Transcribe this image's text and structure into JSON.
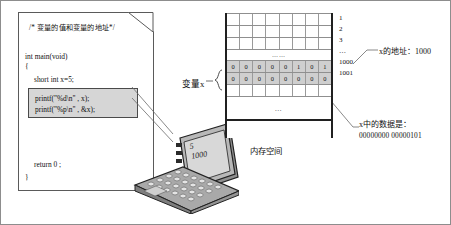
{
  "figure": {
    "title_comment": "/* 变量的值和变量的地址*/",
    "code": {
      "main_signature": "int main(void)",
      "open_brace": "{",
      "declaration": "short int x=5;",
      "printf_value": "printf(\"%d\\n\" , x);",
      "printf_address": "printf(\"%p\\n\" , &x);",
      "return_stmt": "return 0 ;",
      "close_brace": "}"
    },
    "laptop": {
      "screen_line1": "5",
      "screen_line2": "1000"
    },
    "variable_label": "变量x",
    "memory": {
      "caption": "内存空间",
      "rows": [
        {
          "address": "1",
          "cells": [
            "",
            "",
            "",
            "",
            "",
            "",
            "",
            ""
          ],
          "filled": false
        },
        {
          "address": "2",
          "cells": [
            "",
            "",
            "",
            "",
            "",
            "",
            "",
            ""
          ],
          "filled": false
        },
        {
          "address": "3",
          "cells": [
            "",
            "",
            "",
            "",
            "",
            "",
            "",
            ""
          ],
          "filled": false
        },
        {
          "address": "…",
          "cells": [
            "……"
          ],
          "filled": false,
          "dots": true
        },
        {
          "address": "1000",
          "cells": [
            "0",
            "0",
            "0",
            "0",
            "0",
            "1",
            "0",
            "1"
          ],
          "filled": true
        },
        {
          "address": "1001",
          "cells": [
            "0",
            "0",
            "0",
            "0",
            "0",
            "0",
            "0",
            "0"
          ],
          "filled": true
        },
        {
          "address": "",
          "cells": [
            "",
            "",
            "",
            "",
            "",
            "",
            "",
            ""
          ],
          "filled": false
        },
        {
          "address": "",
          "cells": [
            "…"
          ],
          "filled": false,
          "tall_dots": true
        }
      ]
    },
    "annotations": {
      "address_of_x": "x的地址：1000",
      "data_in_x_label": "x中的数据是：",
      "data_in_x_value": "00000000 00000101"
    },
    "colors": {
      "highlight_cell": "#cfcfcf",
      "printf_box": "#d6d6d6",
      "table_border": "#202020",
      "frame": "#8d8d8d"
    }
  }
}
